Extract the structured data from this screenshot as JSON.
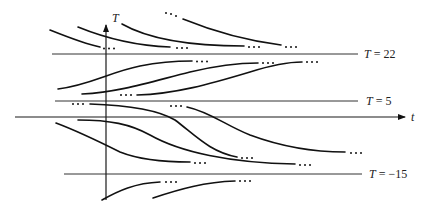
{
  "diagram": {
    "type": "slope-field-solution-curves",
    "axes": {
      "vertical_label": "T",
      "horizontal_label": "t"
    },
    "equilibrium_lines": [
      {
        "label_var": "T",
        "label_eq": " = ",
        "value": "22",
        "text": "T = 22"
      },
      {
        "label_var": "T",
        "label_eq": " = ",
        "value": "5",
        "text": "T = 5"
      },
      {
        "label_var": "T",
        "label_eq": " = ",
        "value": "−15",
        "text": "T = −15"
      }
    ],
    "regions": [
      {
        "name": "above T=22",
        "behavior": "curves decrease toward T = 22",
        "curve_count": 3
      },
      {
        "name": "between T=5 and T=22",
        "behavior": "curves increase toward T = 22",
        "curve_count": 3
      },
      {
        "name": "between T=-15 and T=5",
        "behavior": "curves decrease toward T = -15",
        "curve_count": 4
      },
      {
        "name": "below T=-15",
        "behavior": "curves increase toward T = -15",
        "curve_count": 2
      }
    ],
    "continuation_marker": "…"
  },
  "colors": {
    "ink": "#111111",
    "background": "#ffffff"
  }
}
